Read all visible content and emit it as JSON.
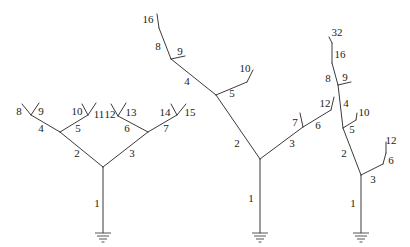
{
  "diagram": {
    "colors": {
      "line": "#3a3a3a",
      "text": "#222222",
      "background": "#ffffff"
    },
    "icons": {
      "ground": "ground-icon"
    },
    "trees": [
      {
        "name": "symmetric-binary-tree",
        "labels": [
          "1",
          "2",
          "3",
          "4",
          "5",
          "6",
          "7",
          "8",
          "9",
          "10",
          "11",
          "12",
          "13",
          "14",
          "15"
        ]
      },
      {
        "name": "asymmetric-tree",
        "labels": [
          "1",
          "2",
          "3",
          "4",
          "5",
          "6",
          "7",
          "8",
          "9",
          "10",
          "12",
          "16"
        ]
      },
      {
        "name": "chain-tree",
        "labels": [
          "1",
          "2",
          "3",
          "4",
          "5",
          "6",
          "8",
          "9",
          "10",
          "12",
          "16",
          "32"
        ]
      }
    ]
  }
}
